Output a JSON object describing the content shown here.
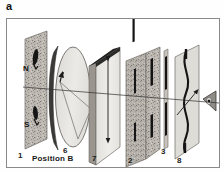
{
  "panel": {
    "letter": "a"
  },
  "figure": {
    "caption_labels": {
      "position_b": "Position B"
    },
    "components": [
      {
        "id": "c1",
        "label": "1",
        "name": "magnet-plate",
        "description": "speckled gray plate with N and S magnetic pole markings"
      },
      {
        "id": "c6",
        "label": "6",
        "name": "disk-lens",
        "description": "elliptical disk with dark rim, at Position B"
      },
      {
        "id": "c7",
        "label": "7",
        "name": "polarizer-plate",
        "description": "light plate with dark top edge and vertical double arrow"
      },
      {
        "id": "c2",
        "label": "2",
        "name": "speckled-plate-pair",
        "description": "two speckled plates with dark vertical bars"
      },
      {
        "id": "c3",
        "label": "3",
        "name": "narrow-strip",
        "description": "thin vertical strip with two dark segments"
      },
      {
        "id": "c8",
        "label": "8",
        "name": "wavy-line-plate",
        "description": "plate with wavy dark vertical line and arrow"
      }
    ],
    "pole_labels": [
      {
        "label": "N",
        "name": "north-pole-label"
      },
      {
        "label": "S",
        "name": "south-pole-label"
      }
    ],
    "eye": {
      "name": "observer-eye",
      "description": "eye symbol indicating viewing direction"
    },
    "optical_axis": {
      "name": "optical-axis",
      "description": "horizontal ray line through all elements"
    }
  },
  "colors": {
    "frame": "#8a8a8a",
    "plate_light": "#e8e6e2",
    "plate_speckle": "#b9b5ae",
    "plate_edge": "#6f6c67",
    "dark": "#1c1c1c",
    "line": "#333333",
    "text": "#1a1a1a"
  }
}
